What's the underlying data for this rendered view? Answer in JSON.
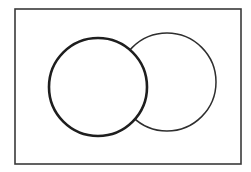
{
  "diagram": {
    "type": "venn",
    "canvas": {
      "width": 251,
      "height": 172,
      "background": "#ffffff"
    },
    "universe": {
      "x": 15,
      "y": 9,
      "width": 226,
      "height": 155,
      "stroke": "#3a3a3a",
      "stroke_width": 1.6
    },
    "sets": [
      {
        "id": "right",
        "cx": 167,
        "cy": 82,
        "r": 49,
        "stroke": "#2e2e2e",
        "stroke_width": 1.5,
        "fill": "#ffffff",
        "layer": "back"
      },
      {
        "id": "left",
        "cx": 98,
        "cy": 87,
        "r": 49,
        "stroke": "#1e1e1e",
        "stroke_width": 2.6,
        "fill": "#ffffff",
        "layer": "front"
      }
    ],
    "labels": []
  }
}
